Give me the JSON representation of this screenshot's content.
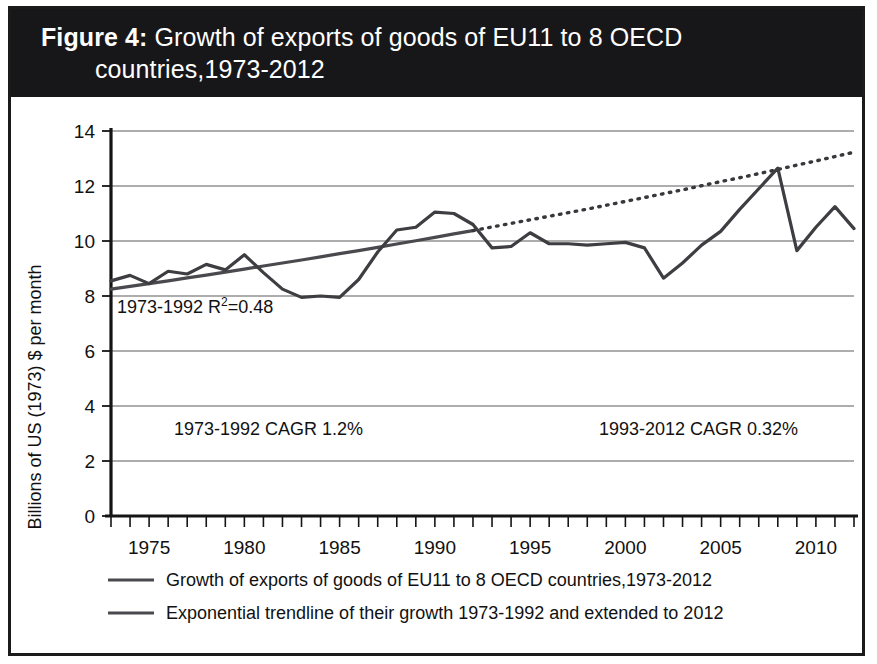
{
  "figure": {
    "label": "Figure 4:",
    "title": "Growth of exports of goods of EU11 to 8 OECD countries,1973-2012",
    "title_line1": "Growth of exports of goods of EU11 to 8 OECD",
    "title_line2": "countries,1973-2012"
  },
  "colors": {
    "banner_background": "#17171a",
    "banner_text": "#ffffff",
    "frame_border": "#1b1b1b",
    "series_line": "#3e3e42",
    "trendline": "#4a4a4e",
    "gridline": "#5c5c5c",
    "plot_background": "#ffffff"
  },
  "annotations": [
    {
      "id": "r-squared",
      "text": "1973-1992 R²=0.48",
      "base": "1973-1992 R",
      "sup": "2",
      "tail": "=0.48"
    },
    {
      "id": "cagr-early",
      "text": "1973-1992 CAGR 1.2%"
    },
    {
      "id": "cagr-late",
      "text": "1993-2012 CAGR 0.32%"
    }
  ],
  "legend": {
    "position": "bottom",
    "items": [
      {
        "label": "Growth of exports of goods of EU11 to 8 OECD countries,1973-2012",
        "style": "solid",
        "color": "#4a4a4e"
      },
      {
        "label": "Exponential trendline of their growth 1973-1992 and extended to 2012",
        "style": "solid",
        "color": "#4a4a4e"
      }
    ]
  },
  "chart_data": {
    "type": "line",
    "title": "Growth of exports of goods of EU11 to 8 OECD countries,1973-2012",
    "xlabel": "",
    "ylabel": "Billions of US (1973) $ per month",
    "xlim": [
      1973,
      2012
    ],
    "ylim": [
      0,
      14
    ],
    "yticks": [
      0,
      2,
      4,
      6,
      8,
      10,
      12,
      14
    ],
    "ytick_labels": [
      "0",
      "2",
      "4",
      "6",
      "8",
      "10",
      "12",
      "14"
    ],
    "xticks": [
      1975,
      1980,
      1985,
      1990,
      1995,
      2000,
      2005,
      2010
    ],
    "xtick_labels": [
      "1975",
      "1980",
      "1985",
      "1990",
      "1995",
      "2000",
      "2005",
      "2010"
    ],
    "xtick_step_minor": 1,
    "grid": true,
    "grid_axis": "y",
    "x": [
      1973,
      1974,
      1975,
      1976,
      1977,
      1978,
      1979,
      1980,
      1981,
      1982,
      1983,
      1984,
      1985,
      1986,
      1987,
      1988,
      1989,
      1990,
      1991,
      1992,
      1993,
      1994,
      1995,
      1996,
      1997,
      1998,
      1999,
      2000,
      2001,
      2002,
      2003,
      2004,
      2005,
      2006,
      2007,
      2008,
      2009,
      2010,
      2011,
      2012
    ],
    "series": [
      {
        "name": "Growth of exports of goods of EU11 to 8 OECD countries,1973-2012",
        "style": "solid",
        "color": "#3e3e42",
        "values": [
          8.55,
          8.75,
          8.45,
          8.9,
          8.8,
          9.15,
          8.95,
          9.5,
          8.85,
          8.25,
          7.95,
          8.0,
          7.95,
          8.6,
          9.6,
          10.4,
          10.5,
          11.05,
          11.0,
          10.6,
          9.75,
          9.8,
          10.3,
          9.9,
          9.9,
          9.85,
          9.9,
          9.95,
          9.75,
          8.65,
          9.2,
          9.85,
          10.35,
          11.15,
          11.9,
          12.65,
          9.65,
          10.5,
          11.25,
          10.45
        ]
      },
      {
        "name": "Exponential trendline of their growth 1973-1992 and extended to 2012",
        "style": "solid-then-dotted",
        "color": "#4a4a4e",
        "fit_range": [
          1973,
          1992
        ],
        "extended_range": [
          1992,
          2012
        ],
        "r_squared": 0.48,
        "cagr_1973_1992_pct": 1.2,
        "cagr_1993_2012_pct": 0.32,
        "values": [
          8.25,
          8.35,
          8.45,
          8.55,
          8.66,
          8.76,
          8.87,
          8.98,
          9.09,
          9.2,
          9.31,
          9.42,
          9.54,
          9.65,
          9.77,
          9.89,
          10.01,
          10.13,
          10.26,
          10.38,
          10.51,
          10.64,
          10.77,
          10.9,
          11.03,
          11.16,
          11.3,
          11.44,
          11.58,
          11.72,
          11.86,
          12.01,
          12.16,
          12.3,
          12.45,
          12.6,
          12.76,
          12.91,
          13.07,
          13.23
        ]
      }
    ]
  }
}
